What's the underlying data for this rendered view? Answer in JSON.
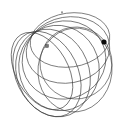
{
  "figure": {
    "title": "Family of orbits through a common point",
    "background_color": "#ffffff",
    "stroke_color": "#3a3a3a",
    "width": 120,
    "height": 123
  },
  "chart_data": {
    "type": "scatter",
    "title": "Family of orbits through a common point",
    "subtitle": "",
    "xlabel": "",
    "ylabel": "",
    "grid": false,
    "legend": false,
    "xlim": [
      0,
      120
    ],
    "ylim": [
      0,
      123
    ],
    "annotations": [],
    "tangent_point": {
      "x": 33,
      "y": 33
    },
    "markers": [
      {
        "name": "open-square-marker",
        "style": "open-square",
        "x": 47,
        "y": 46,
        "color": "#777777",
        "size": 3.0
      },
      {
        "name": "filled-dot-marker",
        "style": "filled-circle",
        "x": 104,
        "y": 42,
        "color": "#0c0c0c",
        "size": 2.6
      },
      {
        "name": "tick-marker",
        "style": "tick",
        "x": 62,
        "y": 12,
        "color": "#5a5a5a",
        "size": 1.2
      }
    ],
    "curves": [
      {
        "name": "orbit-1",
        "kind": "ellipse",
        "cx": 70,
        "cy": 40,
        "rx": 40,
        "ry": 27,
        "rotation": -8,
        "stroke": "#3a3a3a",
        "width": 0.62
      },
      {
        "name": "orbit-2",
        "kind": "ellipse",
        "cx": 68,
        "cy": 50,
        "rx": 42,
        "ry": 33,
        "rotation": -10,
        "stroke": "#3a3a3a",
        "width": 0.62
      },
      {
        "name": "orbit-3",
        "kind": "ellipse",
        "cx": 64,
        "cy": 60,
        "rx": 42,
        "ry": 39,
        "rotation": -14,
        "stroke": "#3a3a3a",
        "width": 0.62
      },
      {
        "name": "orbit-4",
        "kind": "ellipse",
        "cx": 59,
        "cy": 68,
        "rx": 40,
        "ry": 43,
        "rotation": -18,
        "stroke": "#3a3a3a",
        "width": 0.62
      },
      {
        "name": "orbit-5",
        "kind": "ellipse",
        "cx": 53,
        "cy": 73,
        "rx": 36,
        "ry": 45,
        "rotation": -22,
        "stroke": "#3a3a3a",
        "width": 0.62
      },
      {
        "name": "orbit-6",
        "kind": "ellipse",
        "cx": 47,
        "cy": 74,
        "rx": 31,
        "ry": 45,
        "rotation": -26,
        "stroke": "#3a3a3a",
        "width": 0.62
      },
      {
        "name": "orbit-7",
        "kind": "ellipse",
        "cx": 42,
        "cy": 71,
        "rx": 26,
        "ry": 42,
        "rotation": -30,
        "stroke": "#3a3a3a",
        "width": 0.62
      },
      {
        "name": "orbit-8",
        "kind": "ellipse",
        "cx": 75,
        "cy": 70,
        "rx": 37,
        "ry": 42,
        "rotation": 6,
        "stroke": "#555555",
        "width": 0.55
      },
      {
        "name": "orbit-9",
        "kind": "ellipse",
        "cx": 76,
        "cy": 63,
        "rx": 36,
        "ry": 36,
        "rotation": 2,
        "stroke": "#555555",
        "width": 0.55
      }
    ]
  }
}
